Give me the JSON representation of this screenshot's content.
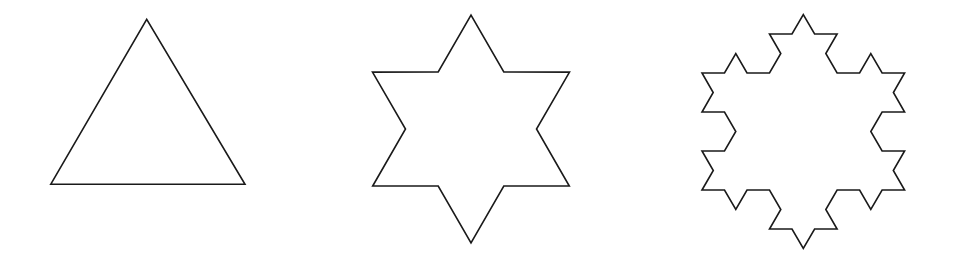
{
  "figure": {
    "stroke_color": "#1a1a1a",
    "background": "#ffffff",
    "shapes": [
      {
        "name": "koch-iteration-0-triangle",
        "iterations": 0,
        "triangle": [
          [
            50.7,
            184.3
          ],
          [
            146.7,
            19.3
          ],
          [
            245.0,
            184.3
          ]
        ]
      },
      {
        "name": "koch-iteration-1-star",
        "iterations": 1,
        "triangle": [
          [
            372.7,
            186.0
          ],
          [
            471.0,
            15.0
          ],
          [
            569.3,
            186.0
          ]
        ]
      },
      {
        "name": "koch-iteration-2-snowflake",
        "iterations": 2,
        "triangle": [
          [
            702.0,
            190.0
          ],
          [
            803.3,
            14.5
          ],
          [
            904.6,
            190.0
          ]
        ]
      }
    ]
  }
}
